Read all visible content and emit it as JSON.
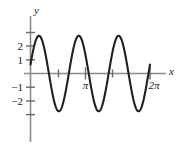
{
  "figure": {
    "background_color": "#ffffff",
    "curve_color": "#231f20",
    "x_axis_color": "#8a8a8a",
    "y_axis_color": "#8a8a8a",
    "text_color": "#1a1a1a"
  },
  "axes": {
    "x_axis_label": "x",
    "y_axis_label": "y",
    "y_tick_labels": [
      "2",
      "1",
      "−1",
      "−2"
    ],
    "y_tick_values": [
      2,
      1,
      -1,
      -2
    ],
    "y_unlabeled_ticks": [
      3,
      -3
    ],
    "x_tick_labels": [
      "π",
      "2π"
    ],
    "x_tick_label_values": [
      3.141592653589793,
      6.283185307179586
    ],
    "x_unlabeled_ticks": [
      1.5707963267948966,
      4.71238898038469
    ]
  },
  "chart_data": {
    "type": "line",
    "title": "",
    "xlabel": "x",
    "ylabel": "y",
    "xlim": [
      -0.25,
      6.9
    ],
    "ylim": [
      -3.6,
      3.4
    ],
    "grid": false,
    "legend": null,
    "function": "y = 3 sin(3x + 0.24)",
    "amplitude": 2.75,
    "frequency": 3,
    "phase": 0.24,
    "cycles_shown": 3,
    "x_tick_positions": [
      1.5707963267948966,
      3.141592653589793,
      4.71238898038469,
      6.283185307179586
    ],
    "x_tick_text": [
      "",
      "π",
      "",
      "2π"
    ],
    "y_tick_positions": [
      3,
      2,
      1,
      -1,
      -2,
      -3
    ],
    "y_tick_text": [
      "",
      "2",
      "1",
      "−1",
      "−2",
      ""
    ],
    "peaks_x": [
      0.6283185307179586,
      1.6755160819145563,
      2.722713633111154
    ],
    "peaks_y": [
      2.75,
      2.75,
      2.75
    ],
    "troughs_x": [
      1.1519173063162575,
      2.199114857512855,
      3.246312408709453
    ],
    "troughs_y": [
      -2.75,
      -2.75,
      -2.75
    ],
    "x": [
      0,
      0.15707963,
      0.31415927,
      0.4712389,
      0.62831853,
      0.78539816,
      0.9424778,
      1.09955743,
      1.25663706,
      1.41371669,
      1.57079633,
      1.72787596,
      1.88495559,
      2.04203522,
      2.19911486,
      2.35619449,
      2.51327412,
      2.67035376,
      2.82743339,
      2.98451302,
      3.14159265,
      3.29867229,
      3.45575192,
      3.61283155,
      3.76991118,
      3.92699082,
      4.08407045,
      4.24115008,
      4.39822972,
      4.55530935,
      4.71238898,
      4.86946861,
      5.02654825,
      5.18362788,
      5.34070751,
      5.49778714,
      5.65486678,
      5.81194641,
      5.96902604,
      6.12610568,
      6.28318531
    ],
    "y": [
      0.654,
      1.977,
      2.718,
      2.657,
      1.809,
      0.426,
      -1.094,
      -2.263,
      -2.748,
      -2.408,
      -1.339,
      0.133,
      1.546,
      2.514,
      2.75,
      2.177,
      0.921,
      -0.639,
      -1.997,
      -2.727,
      -2.644,
      -1.779,
      -0.385,
      1.131,
      2.285,
      2.749,
      2.387,
      1.301,
      -0.177,
      -1.583,
      -2.534,
      -2.747,
      -2.151,
      -0.878,
      0.684,
      2.03,
      2.737,
      2.63,
      1.748,
      0.343,
      -1.169
    ]
  }
}
